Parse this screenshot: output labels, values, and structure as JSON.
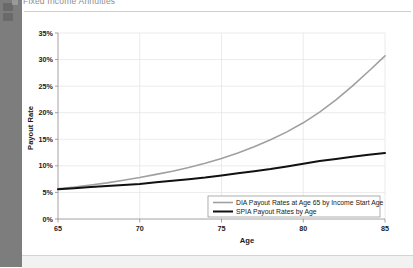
{
  "window": {
    "header_title": "Fixed Income Annuities",
    "header_bullet_icon": "bullet-icon"
  },
  "chart_data": {
    "type": "line",
    "title": "",
    "xlabel": "Age",
    "ylabel": "Payout Rate",
    "xlim": [
      65,
      85
    ],
    "ylim": [
      0,
      35
    ],
    "grid": true,
    "legend_position": "bottom-right",
    "x_ticks": [
      "65",
      "70",
      "75",
      "80",
      "85"
    ],
    "y_ticks": [
      "0%",
      "5%",
      "10%",
      "15%",
      "20%",
      "25%",
      "30%",
      "35%"
    ],
    "x": [
      65,
      66,
      67,
      68,
      69,
      70,
      71,
      72,
      73,
      74,
      75,
      76,
      77,
      78,
      79,
      80,
      81,
      82,
      83,
      84,
      85
    ],
    "series": [
      {
        "name": "DIA Payout Rates at Age 65 by Income Start Age",
        "color": "#a0a0a0",
        "width": 1.6,
        "values": [
          5.7,
          6.0,
          6.4,
          6.8,
          7.3,
          7.8,
          8.4,
          9.0,
          9.7,
          10.5,
          11.4,
          12.4,
          13.6,
          14.9,
          16.4,
          18.1,
          20.1,
          22.4,
          25.0,
          27.8,
          30.7
        ]
      },
      {
        "name": "SPIA Payout Rates by Age",
        "color": "#111111",
        "width": 2.0,
        "values": [
          5.6,
          5.8,
          6.0,
          6.2,
          6.4,
          6.6,
          6.9,
          7.2,
          7.5,
          7.8,
          8.2,
          8.6,
          9.0,
          9.4,
          9.9,
          10.4,
          10.9,
          11.3,
          11.7,
          12.1,
          12.4
        ]
      }
    ]
  }
}
